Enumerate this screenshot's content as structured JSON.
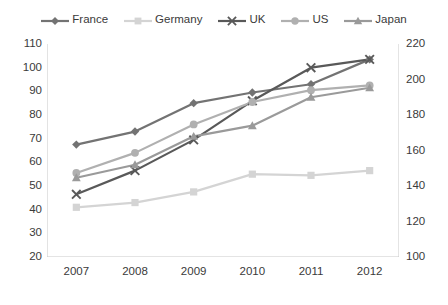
{
  "chart_data": {
    "type": "line",
    "title": "",
    "xlabel": "",
    "ylabel": "",
    "categories": [
      "2007",
      "2008",
      "2009",
      "2010",
      "2011",
      "2012"
    ],
    "x": [
      2007,
      2008,
      2009,
      2010,
      2011,
      2012
    ],
    "grid": false,
    "legend_position": "top",
    "yaxis_left": {
      "min": 20,
      "max": 110,
      "step": 10,
      "ticks": [
        "20",
        "30",
        "40",
        "50",
        "60",
        "70",
        "80",
        "90",
        "100",
        "110"
      ]
    },
    "yaxis_right": {
      "min": 100,
      "max": 220,
      "step": 20,
      "ticks": [
        "100",
        "120",
        "140",
        "160",
        "180",
        "200",
        "220"
      ]
    },
    "series": [
      {
        "name": "France",
        "marker": "diamond",
        "color": "#737373",
        "axis": "left",
        "values": [
          67.5,
          73.0,
          85.0,
          89.5,
          93.0,
          103.5
        ]
      },
      {
        "name": "Germany",
        "marker": "square",
        "color": "#d4d4d4",
        "axis": "left",
        "values": [
          41.0,
          43.0,
          47.5,
          55.0,
          54.5,
          56.5
        ]
      },
      {
        "name": "UK",
        "marker": "cross",
        "color": "#595959",
        "axis": "left",
        "values": [
          46.5,
          56.5,
          69.5,
          86.0,
          100.0,
          103.5
        ]
      },
      {
        "name": "US",
        "marker": "circle",
        "color": "#b0b0b0",
        "axis": "left",
        "values": [
          55.5,
          64.0,
          76.0,
          85.5,
          90.5,
          92.5
        ]
      },
      {
        "name": "Japan",
        "marker": "triangle",
        "color": "#9a9a9a",
        "axis": "left",
        "values": [
          53.5,
          59.0,
          71.0,
          75.5,
          87.5,
          91.5
        ]
      }
    ]
  },
  "legend": {
    "items": [
      {
        "label": "France",
        "icon": "diamond-marker-icon"
      },
      {
        "label": "Germany",
        "icon": "square-marker-icon"
      },
      {
        "label": "UK",
        "icon": "cross-marker-icon"
      },
      {
        "label": "US",
        "icon": "circle-marker-icon"
      },
      {
        "label": "Japan",
        "icon": "triangle-marker-icon"
      }
    ]
  },
  "colors": {
    "axis_line": "#c8c8c8",
    "tick_label": "#3a3a3a",
    "background": "#ffffff"
  }
}
